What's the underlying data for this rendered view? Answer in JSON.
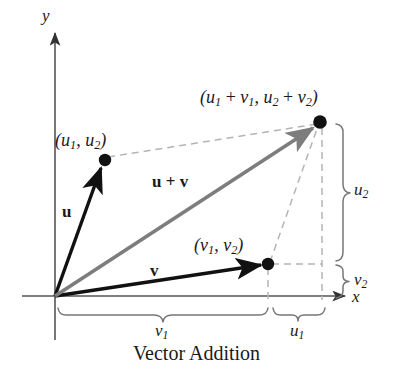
{
  "figure": {
    "caption": "Vector Addition",
    "axes": {
      "x_label": "x",
      "y_label": "y",
      "origin": [
        55,
        296
      ]
    },
    "colors": {
      "vector_u": "#111111",
      "vector_v": "#111111",
      "vector_sum": "#7d7d7d",
      "dashed": "#b4b4b4",
      "axis": "#555555",
      "brace": "#777777",
      "text": "#1a1a1a",
      "background": "#ffffff"
    },
    "points": [
      {
        "name": "point-u",
        "label_open": "(",
        "label_var1": "u",
        "label_sub1": "1",
        "label_sep": ", ",
        "label_var2": "u",
        "label_sub2": "2",
        "label_close": ")",
        "at": [
          105,
          160
        ]
      },
      {
        "name": "point-v",
        "label_open": "(",
        "label_var1": "v",
        "label_sub1": "1",
        "label_sep": ", ",
        "label_var2": "v",
        "label_sub2": "2",
        "label_close": ")",
        "at": [
          268,
          264
        ]
      },
      {
        "name": "point-sum",
        "label_open": "(",
        "label_var1": "u",
        "label_sub1": "1",
        "label_op1": " + ",
        "label_var2": "v",
        "label_sub2": "1",
        "label_sep": ", ",
        "label_var3": "u",
        "label_sub3": "2",
        "label_op2": " + ",
        "label_var4": "v",
        "label_sub4": "2",
        "label_close": ")",
        "at": [
          320,
          122
        ]
      }
    ],
    "vectors": [
      {
        "name": "u",
        "label": "u",
        "from": [
          55,
          296
        ],
        "to": [
          105,
          160
        ]
      },
      {
        "name": "v",
        "label": "v",
        "from": [
          55,
          296
        ],
        "to": [
          268,
          264
        ]
      },
      {
        "name": "u-plus-v",
        "label_u": "u",
        "label_op": " + ",
        "label_v": "v",
        "from": [
          55,
          296
        ],
        "to": [
          320,
          122
        ]
      }
    ],
    "braces": [
      {
        "name": "brace-u2",
        "orientation": "vertical",
        "var": "u",
        "sub": "2",
        "from": [
          122
        ],
        "to": [
          262
        ]
      },
      {
        "name": "brace-v2",
        "orientation": "vertical",
        "var": "v",
        "sub": "2",
        "from": [
          264
        ],
        "to": [
          296
        ]
      },
      {
        "name": "brace-v1",
        "orientation": "horizontal",
        "var": "v",
        "sub": "1",
        "from": [
          57
        ],
        "to": [
          268
        ]
      },
      {
        "name": "brace-u1",
        "orientation": "horizontal",
        "var": "u",
        "sub": "1",
        "from": [
          272
        ],
        "to": [
          325
        ]
      }
    ]
  }
}
